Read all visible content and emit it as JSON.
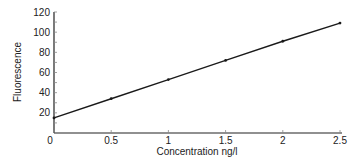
{
  "chart_data": {
    "type": "line",
    "title": "",
    "xlabel": "Concentration ng/l",
    "ylabel": "Fluorescence",
    "xlim": [
      0,
      2.5
    ],
    "ylim": [
      0,
      120
    ],
    "x_ticks": [
      "0",
      "0.5",
      "1",
      "1.5",
      "2",
      "2.5"
    ],
    "y_ticks": [
      "20",
      "40",
      "60",
      "80",
      "100",
      "120"
    ],
    "grid": false,
    "legend": null,
    "series": [
      {
        "name": "Fluorescence",
        "x": [
          0,
          0.5,
          1,
          1.5,
          2,
          2.5
        ],
        "values": [
          15,
          34,
          53,
          72,
          91,
          109
        ]
      }
    ]
  },
  "colors": {
    "axis": "#222222",
    "line": "#1a1a1a"
  }
}
